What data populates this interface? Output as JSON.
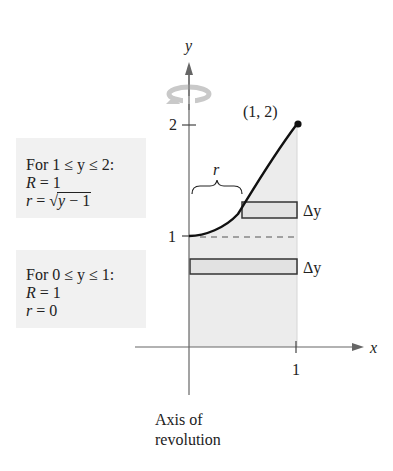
{
  "diagram": {
    "type": "volume-of-revolution-washer-method",
    "axes": {
      "x_label": "x",
      "y_label": "y",
      "x_ticks": [
        {
          "value": 1,
          "label": "1"
        }
      ],
      "y_ticks": [
        {
          "value": 1,
          "label": "1"
        },
        {
          "value": 2,
          "label": "2"
        }
      ]
    },
    "curve": {
      "description": "x = sqrt(y - 1), from (0,1) to (1,2)",
      "endpoint_label": "(1, 2)"
    },
    "region_fill_color": "#ececec",
    "dashed_line": {
      "y": 1,
      "from_x": 0,
      "to_x": 1
    },
    "strips": [
      {
        "name": "upper",
        "label": "Δy",
        "x_from": 0.5,
        "x_to": 1
      },
      {
        "name": "lower",
        "label": "Δy",
        "x_from": 0,
        "x_to": 1
      }
    ],
    "brace_label": "r",
    "rotation_icon": "rotation-arrow-icon",
    "axis_caption_line1": "Axis of",
    "axis_caption_line2": "revolution"
  },
  "info_boxes": {
    "upper": {
      "condition": "For 1 ≤ y ≤ 2:",
      "R_var": "R",
      "R_eq": " = 1",
      "r_var": "r",
      "r_eq": " = ",
      "r_sqrt_symbol": "√",
      "r_radicand_var": "y",
      "r_radicand_rest": " − 1"
    },
    "lower": {
      "condition": "For 0 ≤ y ≤ 1:",
      "R_var": "R",
      "R_eq": " = 1",
      "r_var": "r",
      "r_eq": " = 0"
    }
  }
}
